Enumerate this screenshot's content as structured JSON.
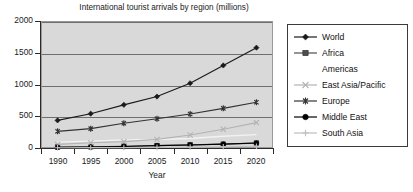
{
  "chart_data": {
    "type": "line",
    "title": "International tourist arrivals by region (millions)",
    "xlabel": "Year",
    "ylabel": "",
    "categories": [
      "1990",
      "1995",
      "2000",
      "2005",
      "2010",
      "2015",
      "2020"
    ],
    "x": [
      1990,
      1995,
      2000,
      2005,
      2010,
      2015,
      2020
    ],
    "ylim": [
      0,
      2000
    ],
    "yticks": [
      0,
      500,
      1000,
      1500,
      2000
    ],
    "ytick_labels": [
      "0",
      "500",
      "1000",
      "1500",
      "2000"
    ],
    "grid": true,
    "legend_position": "right",
    "plot_background": "#d9d9d9",
    "series": [
      {
        "name": "World",
        "marker": "diamond",
        "color": "#1a1a1a",
        "values": [
          435,
          540,
          680,
          810,
          1020,
          1300,
          1580
        ]
      },
      {
        "name": "Africa",
        "marker": "square",
        "color": "#4d4d4d",
        "values": [
          15,
          20,
          28,
          37,
          50,
          60,
          77
        ]
      },
      {
        "name": "Americas",
        "marker": "none",
        "color": "#f2f2f2",
        "values": [
          93,
          109,
          128,
          133,
          150,
          185,
          210
        ]
      },
      {
        "name": "East Asia/Pacific",
        "marker": "x",
        "color": "#b3b3b3",
        "values": [
          56,
          82,
          100,
          135,
          205,
          295,
          400
        ]
      },
      {
        "name": "Europe",
        "marker": "asterisk",
        "color": "#333333",
        "values": [
          262,
          305,
          390,
          460,
          535,
          625,
          720
        ]
      },
      {
        "name": "Middle East",
        "marker": "circle",
        "color": "#000000",
        "values": [
          10,
          14,
          24,
          38,
          48,
          60,
          78
        ]
      },
      {
        "name": "South Asia",
        "marker": "plus",
        "color": "#bfbfbf",
        "values": [
          4,
          5,
          7,
          10,
          14,
          20,
          28
        ]
      }
    ]
  },
  "legend": {
    "items": [
      {
        "label": "World"
      },
      {
        "label": "Africa"
      },
      {
        "label": "Americas"
      },
      {
        "label": "East Asia/Pacific"
      },
      {
        "label": "Europe"
      },
      {
        "label": "Middle East"
      },
      {
        "label": "South Asia"
      }
    ]
  }
}
